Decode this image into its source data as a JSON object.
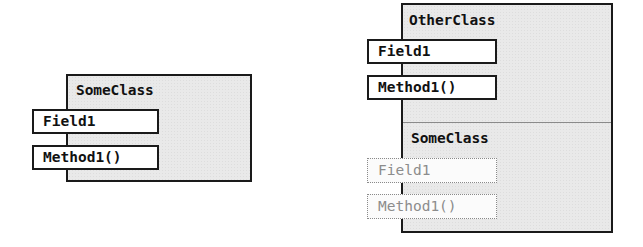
{
  "diagrams": {
    "left": {
      "class_name": "SomeClass",
      "members": [
        {
          "label": "Field1",
          "kind": "field"
        },
        {
          "label": "Method1()",
          "kind": "method"
        }
      ]
    },
    "right": {
      "class_name": "OtherClass",
      "members": [
        {
          "label": "Field1",
          "kind": "field"
        },
        {
          "label": "Method1()",
          "kind": "method"
        }
      ],
      "inherited_section": {
        "class_name": "SomeClass",
        "members": [
          {
            "label": "Field1",
            "kind": "field",
            "inherited": true
          },
          {
            "label": "Method1()",
            "kind": "method",
            "inherited": true
          }
        ]
      }
    }
  },
  "colors": {
    "box_fill": "#e9e9e9",
    "border": "#1a1a1a",
    "inherited_text": "#8c8c8c",
    "inherited_border": "#8a8a8a"
  }
}
